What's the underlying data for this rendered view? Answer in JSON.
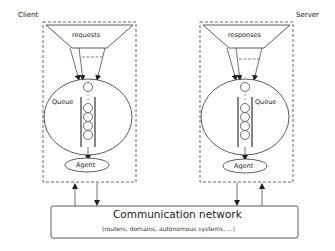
{
  "diagram": {
    "type": "client-server queue architecture",
    "client": {
      "label": "Client",
      "funnel_label": "requests",
      "queue_label": "Queue",
      "agent_label": "Agent"
    },
    "server": {
      "label": "Server",
      "funnel_label": "responses",
      "queue_label": "Queue",
      "agent_label": "Agent"
    },
    "network": {
      "title": "Communication network",
      "subtitle": "(routers, domains, autonomous systems, ...)"
    },
    "colors": {
      "stroke": "#333333",
      "dashed_border": "#444444",
      "background": "#ffffff"
    }
  }
}
